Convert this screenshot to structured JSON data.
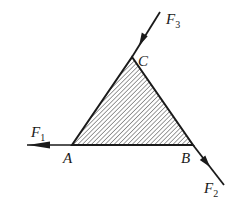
{
  "diagram": {
    "colors": {
      "stroke": "#1a1a1a",
      "hatch": "#3a3a3a",
      "background": "#ffffff"
    },
    "vertices": {
      "A": {
        "label": "A",
        "x": 72,
        "y": 145
      },
      "B": {
        "label": "B",
        "x": 193,
        "y": 145
      },
      "C": {
        "label": "C",
        "x": 132,
        "y": 57
      }
    },
    "forces": [
      {
        "id": "F1",
        "label": "F",
        "subscript": "1",
        "at": "A",
        "direction": "left"
      },
      {
        "id": "F2",
        "label": "F",
        "subscript": "2",
        "at": "B",
        "direction": "down-right along CB"
      },
      {
        "id": "F3",
        "label": "F",
        "subscript": "3",
        "at": "C",
        "direction": "down-left along BC (toward C)"
      }
    ]
  }
}
